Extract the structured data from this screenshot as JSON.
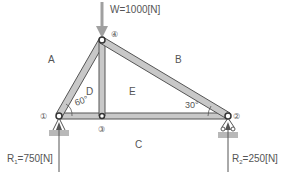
{
  "diagram": {
    "type": "truss",
    "load": {
      "label": "W=1000[N]"
    },
    "reactions": [
      {
        "label_main": "R",
        "label_sub": "1",
        "label_rest": "=750[N]"
      },
      {
        "label_main": "R",
        "label_sub": "2",
        "label_rest": "=250[N]"
      }
    ],
    "nodes": [
      {
        "id": "1",
        "label": "①"
      },
      {
        "id": "2",
        "label": "②"
      },
      {
        "id": "3",
        "label": "③"
      },
      {
        "id": "4",
        "label": "④"
      }
    ],
    "regions": [
      {
        "id": "A",
        "label": "A"
      },
      {
        "id": "B",
        "label": "B"
      },
      {
        "id": "C",
        "label": "C"
      },
      {
        "id": "D",
        "label": "D"
      },
      {
        "id": "E",
        "label": "E"
      }
    ],
    "angles": [
      {
        "at": "node-1",
        "label": "60°"
      },
      {
        "at": "node-2",
        "label": "30°"
      }
    ],
    "colors": {
      "member_fill": "#c8c8c8",
      "member_stroke": "#555555",
      "arrow": "#9a9a9a",
      "text": "#555555",
      "support": "#b0b0b0"
    }
  }
}
